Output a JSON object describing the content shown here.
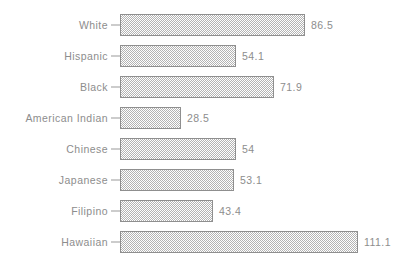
{
  "chart_data": {
    "type": "bar",
    "orientation": "horizontal",
    "title": "",
    "subtitle": "",
    "xlabel": "",
    "ylabel": "",
    "grid": false,
    "legend": false,
    "axis_visible": false,
    "xlim": [
      0,
      111.1
    ],
    "categories": [
      "White",
      "Hispanic",
      "Black",
      "American Indian",
      "Chinese",
      "Japanese",
      "Filipino",
      "Hawaiian"
    ],
    "values": [
      86.5,
      54.1,
      71.9,
      28.5,
      54,
      53.1,
      43.4,
      111.1
    ],
    "value_labels": [
      "86.5",
      "54.1",
      "71.9",
      "28.5",
      "54",
      "53.1",
      "43.4",
      "111.1"
    ],
    "bars": [
      {
        "label": "White",
        "value": 86.5,
        "value_label": "86.5"
      },
      {
        "label": "Hispanic",
        "value": 54.1,
        "value_label": "54.1"
      },
      {
        "label": "Black",
        "value": 71.9,
        "value_label": "71.9"
      },
      {
        "label": "American Indian",
        "value": 28.5,
        "value_label": "28.5"
      },
      {
        "label": "Chinese",
        "value": 54,
        "value_label": "54"
      },
      {
        "label": "Japanese",
        "value": 53.1,
        "value_label": "53.1"
      },
      {
        "label": "Filipino",
        "value": 43.4,
        "value_label": "43.4"
      },
      {
        "label": "Hawaiian",
        "value": 111.1,
        "value_label": "111.1"
      }
    ],
    "colors": {
      "background": "#ffffff",
      "bar_fill_pattern": "#b4b4b4",
      "bar_border": "#8f8f8f",
      "text": "#8d8d8d",
      "tick": "#9a9a9a"
    }
  },
  "layout": {
    "bar_origin_x": 120,
    "px_per_unit": 2.143,
    "row_pitch": 31,
    "first_row_top": 9,
    "bar_height": 22,
    "value_gap": 6
  }
}
